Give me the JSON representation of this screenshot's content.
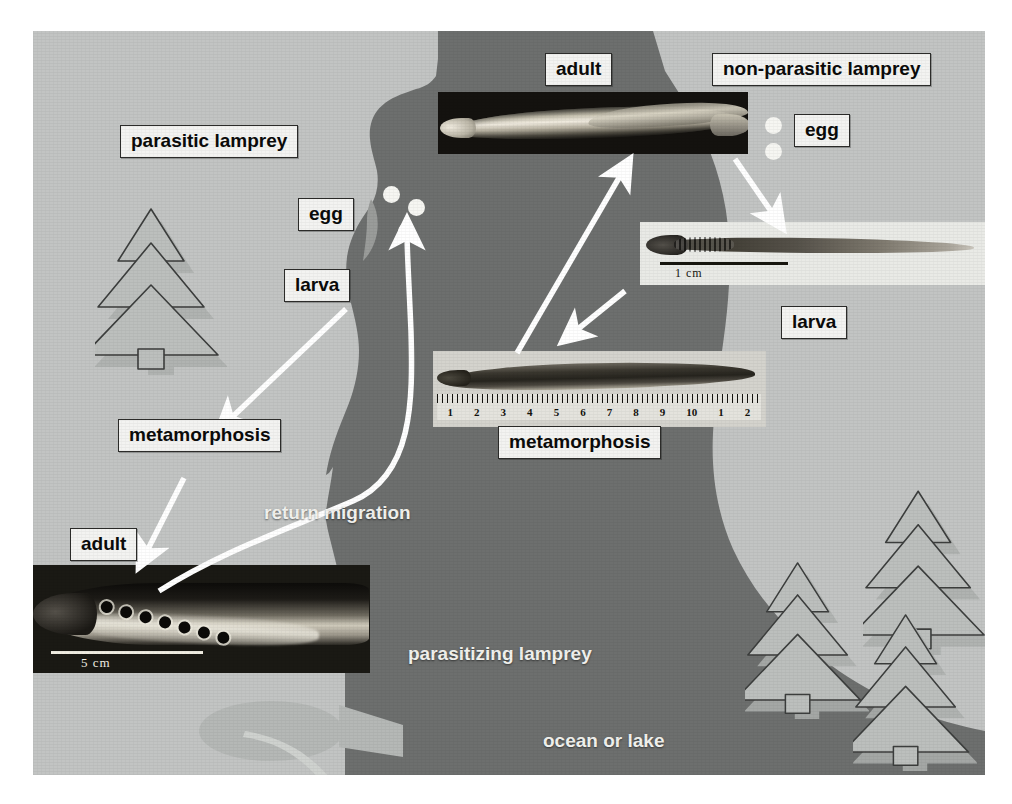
{
  "figure": {
    "colors": {
      "land": "#c2c4c3",
      "water": "#6d6f6e",
      "label_bg": "#f3f3f1",
      "label_border": "#2c2c2a",
      "label_text": "#0b0b0a",
      "plain_text": "#f2f2ee",
      "egg": "#f6f6f2",
      "tree_fill": "#b9bcba",
      "tree_stroke": "#3b3d3c",
      "arrow": "#ffffff",
      "fish": "#b5b8b6"
    }
  },
  "labels": {
    "parasitic_lamprey": "parasitic lamprey",
    "non_parasitic_lamprey": "non-parasitic lamprey",
    "adult_top": "adult",
    "egg_left": "egg",
    "egg_right": "egg",
    "larva_left": "larva",
    "larva_right": "larva",
    "metamorphosis_left": "metamorphosis",
    "metamorphosis_center": "metamorphosis",
    "adult_bottom": "adult",
    "return_migration": "return migration",
    "parasitizing_lamprey": "parasitizing lamprey",
    "ocean_or_lake": "ocean or lake"
  },
  "photos": {
    "adult_top": {
      "caption": "adult",
      "scale": ""
    },
    "larva_right": {
      "caption": "larva",
      "scale": "1  cm"
    },
    "metamorphosis_center": {
      "caption": "metamorphosis",
      "ruler_numbers": [
        "1",
        "2",
        "3",
        "4",
        "5",
        "6",
        "7",
        "8",
        "9",
        "10",
        "1",
        "2"
      ]
    },
    "adult_bottom": {
      "caption": "adult",
      "scale": "5 cm"
    }
  },
  "annotations": {
    "eggs_left_count": 3,
    "eggs_right_count": 2,
    "trees_left_count": 1,
    "trees_right_count": 3
  }
}
